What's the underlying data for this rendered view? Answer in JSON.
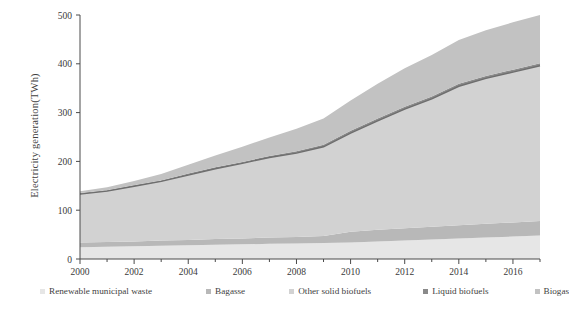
{
  "chart_data": {
    "type": "area",
    "title": "",
    "xlabel": "",
    "ylabel": "Electricity generation(TWh)",
    "stacked": true,
    "grid": false,
    "legend_position": "bottom",
    "xlim": [
      2000,
      2017
    ],
    "ylim": [
      0,
      500
    ],
    "ytick_labels": [
      "0",
      "100",
      "200",
      "300",
      "400",
      "500"
    ],
    "ytick_values": [
      0,
      100,
      200,
      300,
      400,
      500
    ],
    "xtick_labels": [
      "2000",
      "2002",
      "2004",
      "2006",
      "2008",
      "2010",
      "2012",
      "2014",
      "2016"
    ],
    "xtick_values": [
      2000,
      2002,
      2004,
      2006,
      2008,
      2010,
      2012,
      2014,
      2016
    ],
    "x": [
      2000,
      2001,
      2002,
      2003,
      2004,
      2005,
      2006,
      2007,
      2008,
      2009,
      2010,
      2011,
      2012,
      2013,
      2014,
      2015,
      2016,
      2017
    ],
    "series": [
      {
        "name": "Renewable municipal waste",
        "color": "#e6e6e6",
        "values": [
          24,
          25,
          26,
          27,
          28,
          29,
          30,
          31,
          32,
          33,
          34,
          36,
          38,
          40,
          42,
          44,
          46,
          48
        ]
      },
      {
        "name": "Bagasse",
        "color": "#b8b8b8",
        "values": [
          10,
          10,
          10,
          11,
          11,
          12,
          12,
          13,
          13,
          14,
          22,
          24,
          25,
          26,
          27,
          28,
          29,
          30
        ]
      },
      {
        "name": "Other solid biofuels",
        "color": "#d2d2d2",
        "values": [
          99,
          104,
          113,
          121,
          133,
          144,
          154,
          164,
          172,
          183,
          202,
          223,
          244,
          262,
          285,
          298,
          308,
          318
        ]
      },
      {
        "name": "Liquid biofuels",
        "color": "#8a8a8a",
        "values": [
          2,
          2,
          2,
          2,
          3,
          3,
          3,
          3,
          4,
          4,
          5,
          5,
          5,
          5,
          5,
          5,
          5,
          5
        ]
      },
      {
        "name": "Biogas",
        "color": "#c2c2c2",
        "values": [
          4,
          6,
          9,
          13,
          18,
          24,
          31,
          38,
          46,
          54,
          62,
          71,
          79,
          85,
          90,
          94,
          97,
          99
        ]
      }
    ],
    "annotations": [
      {
        "name": "cumulative-top-of-other-solid-biofuels",
        "description": "dark outline curve marking top of Other solid biofuels band",
        "color": "#6e6e6e",
        "values": [
          133,
          139,
          149,
          159,
          172,
          185,
          196,
          208,
          217,
          230,
          258,
          283,
          307,
          328,
          354,
          370,
          383,
          396
        ]
      }
    ]
  },
  "axis": {
    "y_title": "Electricity generation(TWh)"
  },
  "legend": {
    "items": [
      {
        "label": "Renewable municipal waste",
        "color": "#e6e6e6"
      },
      {
        "label": "Bagasse",
        "color": "#b8b8b8"
      },
      {
        "label": "Other solid biofuels",
        "color": "#d2d2d2"
      },
      {
        "label": "Liquid biofuels",
        "color": "#8a8a8a"
      },
      {
        "label": "Biogas",
        "color": "#c2c2c2"
      }
    ]
  }
}
